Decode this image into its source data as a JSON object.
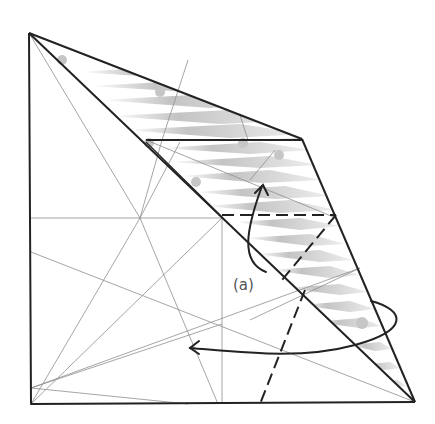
{
  "diagram": {
    "type": "origami-fold-step",
    "labels": {
      "a": "(a)"
    },
    "colors": {
      "background": "#ffffff",
      "outline": "#222222",
      "crease": "#9a9a9a",
      "shading": "#b8b8b8",
      "dot": "#c4c4c4"
    },
    "elements": [
      "square-paper-outline",
      "diagonal-fold-edge",
      "shaded-folded-flap",
      "dashed-valley-fold-lines",
      "fold-arrow-up",
      "fold-arrow-around-left",
      "precrease-lines"
    ]
  }
}
